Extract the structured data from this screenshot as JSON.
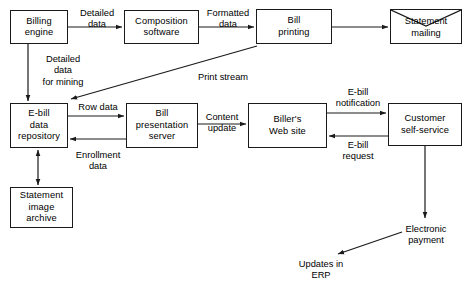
{
  "diagram": {
    "type": "flowchart",
    "background_color": "#ffffff",
    "stroke_color": "#1a1a1a",
    "text_color": "#000000",
    "nodes": [
      {
        "id": "billing-engine",
        "label": "Billing\nengine",
        "shape": "rectangle",
        "x": 10,
        "y": 10,
        "w": 58,
        "h": 34
      },
      {
        "id": "composition-software",
        "label": "Composition\nsoftware",
        "shape": "rectangle",
        "x": 124,
        "y": 10,
        "w": 75,
        "h": 34
      },
      {
        "id": "bill-printing",
        "label": "Bill\nprinting",
        "shape": "rectangle",
        "x": 256,
        "y": 9,
        "w": 76,
        "h": 35
      },
      {
        "id": "statement-mailing",
        "label": "Statement\nmailing",
        "shape": "envelope",
        "x": 390,
        "y": 9,
        "w": 72,
        "h": 35
      },
      {
        "id": "ebill-data-repository",
        "label": "E-bill\ndata\nrepository",
        "shape": "rectangle",
        "x": 10,
        "y": 103,
        "w": 58,
        "h": 45
      },
      {
        "id": "bill-presentation-server",
        "label": "Bill\npresentation\nserver",
        "shape": "rectangle",
        "x": 126,
        "y": 103,
        "w": 72,
        "h": 45
      },
      {
        "id": "billers-web-site",
        "label": "Biller's\nWeb site",
        "shape": "rectangle",
        "x": 248,
        "y": 103,
        "w": 79,
        "h": 45
      },
      {
        "id": "customer-self-service",
        "label": "Customer\nself-service",
        "shape": "rectangle",
        "x": 388,
        "y": 103,
        "w": 74,
        "h": 43
      },
      {
        "id": "statement-image-archive",
        "label": "Statement\nimage\narchive",
        "shape": "rectangle",
        "x": 10,
        "y": 187,
        "w": 63,
        "h": 41
      }
    ],
    "edge_labels": [
      {
        "id": "detailed-data",
        "text": "Detailed\ndata",
        "x": 70,
        "y": 8,
        "w": 54
      },
      {
        "id": "formatted-data",
        "text": "Formatted\ndata",
        "x": 199,
        "y": 8,
        "w": 58
      },
      {
        "id": "detailed-data-for-mining",
        "text": "Detailed\ndata\nfor mining",
        "x": 32,
        "y": 54,
        "w": 62
      },
      {
        "id": "print-stream",
        "text": "Print stream",
        "x": 188,
        "y": 72,
        "w": 70
      },
      {
        "id": "row-data",
        "text": "Row data",
        "x": 72,
        "y": 102,
        "w": 52
      },
      {
        "id": "content-update",
        "text": "Content\nupdate",
        "x": 196,
        "y": 112,
        "w": 52
      },
      {
        "id": "ebill-notification",
        "text": "E-bill\nnotification",
        "x": 327,
        "y": 87,
        "w": 62
      },
      {
        "id": "ebill-request",
        "text": "E-bill\nrequest",
        "x": 330,
        "y": 140,
        "w": 56
      },
      {
        "id": "enrollment-data",
        "text": "Enrollment\ndata",
        "x": 64,
        "y": 150,
        "w": 68
      },
      {
        "id": "electronic-payment",
        "text": "Electronic\npayment",
        "x": 390,
        "y": 224,
        "w": 72
      },
      {
        "id": "updates-in-erp",
        "text": "Updates in\nERP",
        "x": 285,
        "y": 259,
        "w": 72
      }
    ],
    "connectors": [
      {
        "id": "billing-to-composition",
        "from": "billing-engine",
        "to": "composition-software",
        "label": "detailed-data",
        "direction": "forward"
      },
      {
        "id": "composition-to-printing",
        "from": "composition-software",
        "to": "bill-printing",
        "label": "formatted-data",
        "direction": "forward"
      },
      {
        "id": "printing-to-mailing",
        "from": "bill-printing",
        "to": "statement-mailing",
        "label": "",
        "direction": "forward"
      },
      {
        "id": "billing-to-repository",
        "from": "billing-engine",
        "to": "ebill-data-repository",
        "label": "detailed-data-for-mining",
        "direction": "forward"
      },
      {
        "id": "printing-to-repository",
        "from": "bill-printing",
        "to": "ebill-data-repository",
        "label": "print-stream",
        "direction": "forward"
      },
      {
        "id": "repository-to-presentation",
        "from": "ebill-data-repository",
        "to": "bill-presentation-server",
        "label": "row-data",
        "direction": "forward"
      },
      {
        "id": "presentation-to-repository",
        "from": "bill-presentation-server",
        "to": "ebill-data-repository",
        "label": "",
        "direction": "forward"
      },
      {
        "id": "presentation-to-website",
        "from": "bill-presentation-server",
        "to": "billers-web-site",
        "label": "content-update",
        "direction": "forward"
      },
      {
        "id": "website-to-customer",
        "from": "billers-web-site",
        "to": "customer-self-service",
        "label": "ebill-notification",
        "direction": "forward"
      },
      {
        "id": "customer-to-website",
        "from": "customer-self-service",
        "to": "billers-web-site",
        "label": "ebill-request",
        "direction": "forward"
      },
      {
        "id": "repository-archive-bidirectional",
        "from": "ebill-data-repository",
        "to": "statement-image-archive",
        "label": "enrollment-data",
        "direction": "both"
      },
      {
        "id": "customer-to-payment",
        "from": "customer-self-service",
        "to": "electronic-payment",
        "label": "",
        "direction": "forward"
      },
      {
        "id": "payment-to-erp",
        "from": "electronic-payment",
        "to": "updates-in-erp",
        "label": "",
        "direction": "forward"
      }
    ]
  }
}
